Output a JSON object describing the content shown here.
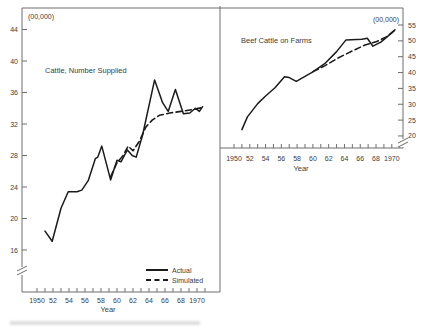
{
  "figure": {
    "legend": {
      "actual_label": "Actual",
      "simulated_label": "Simulated"
    }
  },
  "chart_data": [
    {
      "type": "line",
      "title": "Cattle, Number Supplied",
      "unit_label": "(00,000)",
      "xlabel": "Year",
      "y_axis_side": "left",
      "x_range": [
        1950,
        1971
      ],
      "x_tick_step": 1,
      "x_label_years": [
        1950,
        1952,
        1954,
        1956,
        1958,
        1960,
        1962,
        1964,
        1966,
        1968,
        1970
      ],
      "x_tick_labels": [
        "1950",
        "52",
        "54",
        "56",
        "58",
        "60",
        "62",
        "64",
        "66",
        "68",
        "1970"
      ],
      "y_ticks": [
        16,
        20,
        24,
        28,
        32,
        36,
        40,
        44
      ],
      "y_range": [
        16,
        44
      ],
      "axis_break_below_min": true,
      "grid": false,
      "series": [
        {
          "name": "Actual",
          "style": "solid",
          "points": [
            [
              1951.0,
              18.4
            ],
            [
              1951.9,
              17.1
            ],
            [
              1953.0,
              21.3
            ],
            [
              1953.9,
              23.4
            ],
            [
              1955.0,
              23.4
            ],
            [
              1955.6,
              23.6
            ],
            [
              1956.4,
              24.8
            ],
            [
              1957.3,
              27.6
            ],
            [
              1957.6,
              27.8
            ],
            [
              1958.1,
              29.2
            ],
            [
              1959.2,
              24.9
            ],
            [
              1960.0,
              27.4
            ],
            [
              1960.5,
              27.2
            ],
            [
              1961.3,
              28.7
            ],
            [
              1961.9,
              28.0
            ],
            [
              1962.4,
              27.8
            ],
            [
              1963.2,
              30.6
            ],
            [
              1964.7,
              37.6
            ],
            [
              1965.7,
              34.7
            ],
            [
              1966.4,
              33.6
            ],
            [
              1967.3,
              36.4
            ],
            [
              1968.3,
              33.3
            ],
            [
              1969.1,
              33.4
            ],
            [
              1969.8,
              34.0
            ],
            [
              1970.3,
              33.6
            ],
            [
              1970.7,
              34.2
            ]
          ]
        },
        {
          "name": "Simulated",
          "style": "dashed",
          "points": [
            [
              1959.2,
              25.3
            ],
            [
              1960.0,
              27.1
            ],
            [
              1960.7,
              27.9
            ],
            [
              1961.4,
              29.2
            ],
            [
              1962.0,
              28.6
            ],
            [
              1962.8,
              29.8
            ],
            [
              1963.6,
              31.6
            ],
            [
              1964.4,
              32.5
            ],
            [
              1965.3,
              33.1
            ],
            [
              1966.6,
              33.4
            ],
            [
              1968.0,
              33.6
            ],
            [
              1969.3,
              33.8
            ],
            [
              1970.7,
              34.1
            ]
          ]
        }
      ]
    },
    {
      "type": "line",
      "title": "Beef Cattle on Farms",
      "unit_label": "(00,000)",
      "xlabel": "Year",
      "y_axis_side": "right",
      "x_range": [
        1950,
        1971
      ],
      "x_tick_step": 1,
      "x_label_years": [
        1950,
        1952,
        1954,
        1956,
        1958,
        1960,
        1962,
        1964,
        1966,
        1968,
        1970
      ],
      "x_tick_labels": [
        "1950",
        "52",
        "54",
        "56",
        "58",
        "60",
        "62",
        "64",
        "66",
        "68",
        "1970"
      ],
      "y_ticks": [
        20,
        25,
        30,
        35,
        40,
        45,
        50,
        55
      ],
      "y_range": [
        20,
        55
      ],
      "axis_break_below_min": true,
      "grid": false,
      "series": [
        {
          "name": "Actual",
          "style": "solid",
          "points": [
            [
              1951.0,
              22.0
            ],
            [
              1951.7,
              26.0
            ],
            [
              1953.0,
              30.2
            ],
            [
              1954.0,
              32.6
            ],
            [
              1955.2,
              35.2
            ],
            [
              1956.4,
              38.7
            ],
            [
              1957.0,
              38.4
            ],
            [
              1957.9,
              37.2
            ],
            [
              1960.0,
              40.2
            ],
            [
              1961.5,
              42.8
            ],
            [
              1963.0,
              46.6
            ],
            [
              1964.2,
              50.3
            ],
            [
              1966.2,
              50.5
            ],
            [
              1966.9,
              50.8
            ],
            [
              1967.6,
              48.3
            ],
            [
              1968.6,
              49.6
            ],
            [
              1970.0,
              52.5
            ],
            [
              1970.4,
              53.5
            ]
          ]
        },
        {
          "name": "Simulated",
          "style": "dashed",
          "points": [
            [
              1960.0,
              40.3
            ],
            [
              1961.5,
              42.1
            ],
            [
              1963.2,
              44.6
            ],
            [
              1964.9,
              46.7
            ],
            [
              1966.6,
              48.7
            ],
            [
              1968.1,
              49.8
            ],
            [
              1969.3,
              51.2
            ],
            [
              1970.4,
              53.4
            ]
          ]
        }
      ]
    }
  ]
}
